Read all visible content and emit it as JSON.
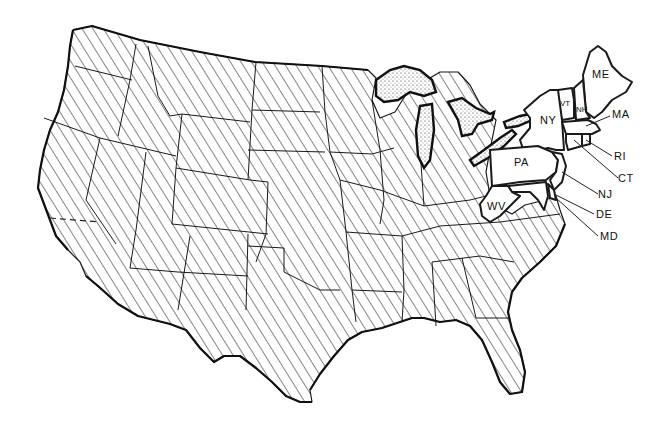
{
  "map": {
    "title": "Contiguous United States",
    "style": "black-and-white line art",
    "hatched_fill_meaning": "states not highlighted",
    "colors": {
      "ink": "#111111",
      "background": "#ffffff",
      "lake_fill": "stippled"
    },
    "highlighted_states": [
      {
        "abbr": "ME",
        "name": "Maine",
        "label_position": "inside"
      },
      {
        "abbr": "VT",
        "name": "Vermont",
        "label_position": "inside"
      },
      {
        "abbr": "NH",
        "name": "New Hampshire",
        "label_position": "inside"
      },
      {
        "abbr": "NY",
        "name": "New York",
        "label_position": "inside"
      },
      {
        "abbr": "PA",
        "name": "Pennsylvania",
        "label_position": "inside"
      },
      {
        "abbr": "WV",
        "name": "West Virginia",
        "label_position": "inside"
      },
      {
        "abbr": "MA",
        "name": "Massachusetts",
        "label_position": "callout"
      },
      {
        "abbr": "RI",
        "name": "Rhode Island",
        "label_position": "callout"
      },
      {
        "abbr": "CT",
        "name": "Connecticut",
        "label_position": "callout"
      },
      {
        "abbr": "NJ",
        "name": "New Jersey",
        "label_position": "callout"
      },
      {
        "abbr": "DE",
        "name": "Delaware",
        "label_position": "callout"
      },
      {
        "abbr": "MD",
        "name": "Maryland",
        "label_position": "callout"
      }
    ],
    "labels": {
      "me": "ME",
      "vt": "VT",
      "nh": "NH",
      "ny": "NY",
      "pa": "PA",
      "wv": "WV",
      "ma": "MA",
      "ri": "RI",
      "ct": "CT",
      "nj": "NJ",
      "de": "DE",
      "md": "MD"
    },
    "features": [
      "Great Lakes (stippled)",
      "hatched remaining states",
      "dashed boundary in southern California"
    ]
  }
}
